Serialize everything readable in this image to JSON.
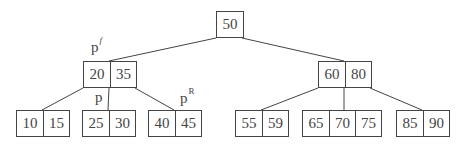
{
  "diagram": {
    "type": "b-tree",
    "nodes": {
      "root": {
        "keys": [
          "50"
        ]
      },
      "internal_left": {
        "keys": [
          "20",
          "35"
        ]
      },
      "internal_right": {
        "keys": [
          "60",
          "80"
        ]
      },
      "leaf_1": {
        "keys": [
          "10",
          "15"
        ]
      },
      "leaf_2": {
        "keys": [
          "25",
          "30"
        ]
      },
      "leaf_3": {
        "keys": [
          "40",
          "45"
        ]
      },
      "leaf_4": {
        "keys": [
          "55",
          "59"
        ]
      },
      "leaf_5": {
        "keys": [
          "65",
          "70",
          "75"
        ]
      },
      "leaf_6": {
        "keys": [
          "85",
          "90"
        ]
      }
    },
    "labels": {
      "parent": {
        "base": "p",
        "sup": "f"
      },
      "current": {
        "base": "p",
        "sup": ""
      },
      "right_sibling": {
        "base": "p",
        "sup": "R"
      }
    },
    "edges": [
      [
        "root",
        "internal_left"
      ],
      [
        "root",
        "internal_right"
      ],
      [
        "internal_left",
        "leaf_1"
      ],
      [
        "internal_left",
        "leaf_2"
      ],
      [
        "internal_left",
        "leaf_3"
      ],
      [
        "internal_right",
        "leaf_4"
      ],
      [
        "internal_right",
        "leaf_5"
      ],
      [
        "internal_right",
        "leaf_6"
      ]
    ]
  }
}
